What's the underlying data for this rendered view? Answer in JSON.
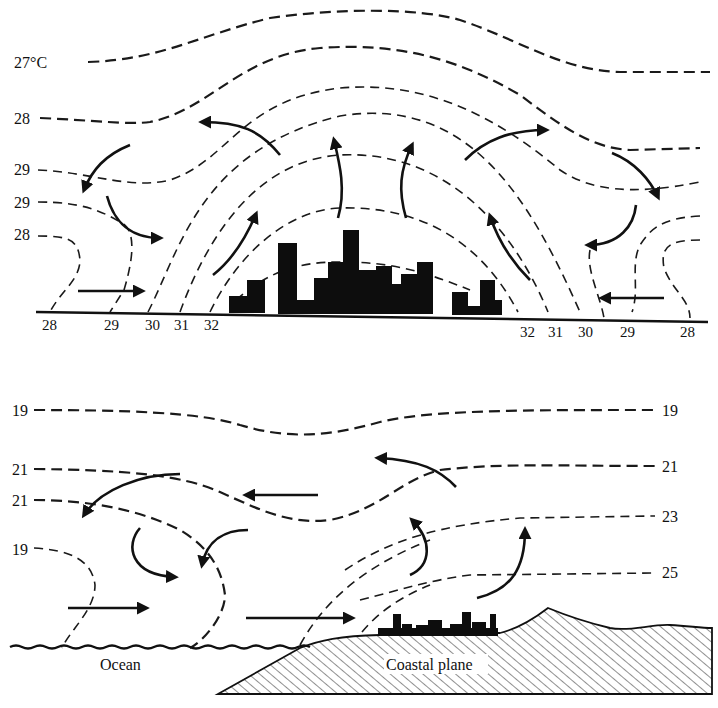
{
  "figure": {
    "top_panel": {
      "description": "Urban heat island circulation over a city",
      "left_isotherm_labels": [
        "27°C",
        "28",
        "29",
        "29",
        "28"
      ],
      "bottom_labels_left": [
        "28",
        "29",
        "30",
        "31",
        "32"
      ],
      "bottom_labels_right": [
        "32",
        "31",
        "30",
        "29",
        "28"
      ]
    },
    "bottom_panel": {
      "description": "Coastal city with sea breeze circulation",
      "left_isotherm_labels": [
        "19",
        "21",
        "21",
        "19"
      ],
      "right_isotherm_labels": [
        "19",
        "21",
        "23",
        "25"
      ],
      "surface_labels": {
        "ocean": "Ocean",
        "coastal_plain": "Coastal plane"
      }
    },
    "colors": {
      "ink": "#111111",
      "background": "#ffffff"
    }
  }
}
